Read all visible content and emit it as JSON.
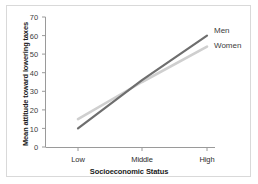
{
  "chart_data": {
    "type": "line",
    "title": "",
    "xlabel": "Socioeconomic Status",
    "ylabel": "Mean attitude toward lowering taxes",
    "categories": [
      "Low",
      "Middle",
      "High"
    ],
    "yticks": [
      "0",
      "10",
      "20",
      "30",
      "40",
      "50",
      "60",
      "70"
    ],
    "ylim": [
      0,
      70
    ],
    "grid": false,
    "legend_position": "right-inline",
    "series": [
      {
        "name": "Men",
        "values": [
          10,
          36,
          60
        ],
        "color": "#6e6e6e"
      },
      {
        "name": "Women",
        "values": [
          15,
          35,
          54
        ],
        "color": "#cfcfcf"
      }
    ]
  },
  "axes": {
    "y_tick_0": "0",
    "y_tick_1": "10",
    "y_tick_2": "20",
    "y_tick_3": "30",
    "y_tick_4": "40",
    "y_tick_5": "50",
    "y_tick_6": "60",
    "y_tick_7": "70",
    "x_tick_0": "Low",
    "x_tick_1": "Middle",
    "x_tick_2": "High"
  },
  "labels": {
    "men": "Men",
    "women": "Women"
  },
  "colors": {
    "men_line": "#6e6e6e",
    "women_line": "#cfcfcf",
    "axis": "#9a9a9a",
    "frame": "#d9d9d9",
    "text": "#2b2b2b"
  }
}
